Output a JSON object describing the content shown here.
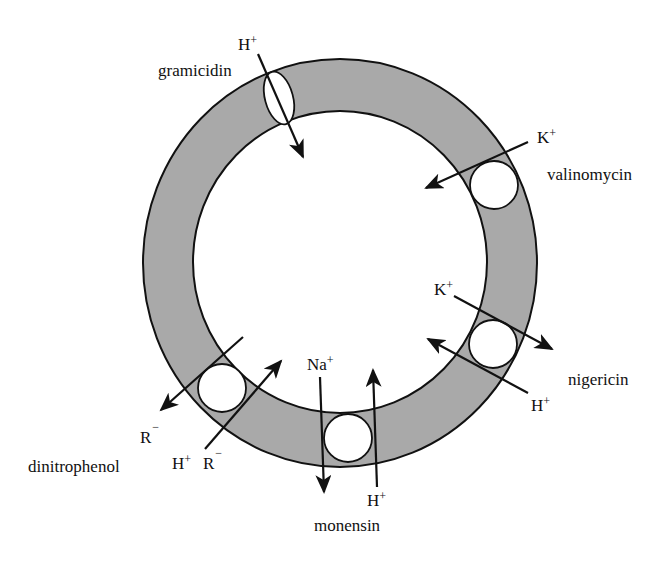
{
  "diagram": {
    "type": "membrane-ionophore-schematic",
    "colors": {
      "membrane_fill": "#a9a9a9",
      "stroke": "#111111",
      "background": "#ffffff",
      "pore_fill": "#ffffff"
    },
    "ionophores": [
      {
        "name": "gramicidin",
        "label": "gramicidin",
        "shape": "channel (ellipse)",
        "ions": [
          {
            "ion": "H",
            "charge": "+",
            "direction": "inward"
          }
        ]
      },
      {
        "name": "valinomycin",
        "label": "valinomycin",
        "shape": "carrier (circle)",
        "ions": [
          {
            "ion": "K",
            "charge": "+",
            "direction": "inward"
          }
        ]
      },
      {
        "name": "nigericin",
        "label": "nigericin",
        "shape": "carrier (circle)",
        "ions": [
          {
            "ion": "K",
            "charge": "+",
            "direction": "outward"
          },
          {
            "ion": "H",
            "charge": "+",
            "direction": "inward"
          }
        ]
      },
      {
        "name": "monensin",
        "label": "monensin",
        "shape": "carrier (circle)",
        "ions": [
          {
            "ion": "Na",
            "charge": "+",
            "direction": "outward"
          },
          {
            "ion": "H",
            "charge": "+",
            "direction": "inward"
          }
        ]
      },
      {
        "name": "dinitrophenol",
        "label": "dinitrophenol",
        "shape": "carrier (circle)",
        "ions": [
          {
            "ion": "R",
            "charge": "−",
            "direction": "outward"
          },
          {
            "ion": "H+ R",
            "charge": "−",
            "direction": "inward"
          }
        ]
      }
    ],
    "labels": {
      "gramicidin_name": "gramicidin",
      "gramicidin_ion": "H",
      "gramicidin_charge": "+",
      "valinomycin_name": "valinomycin",
      "valinomycin_ion": "K",
      "valinomycin_charge": "+",
      "nigericin_name": "nigericin",
      "nigericin_ion_k": "K",
      "nigericin_ion_k_charge": "+",
      "nigericin_ion_h": "H",
      "nigericin_ion_h_charge": "+",
      "monensin_name": "monensin",
      "monensin_ion_na": "Na",
      "monensin_ion_na_charge": "+",
      "monensin_ion_h": "H",
      "monensin_ion_h_charge": "+",
      "dinitrophenol_name": "dinitrophenol",
      "dinitrophenol_out_ion": "R",
      "dinitrophenol_out_charge": "−",
      "dinitrophenol_in_ion_h": "H",
      "dinitrophenol_in_ion_h_charge": "+",
      "dinitrophenol_in_ion_r": "R",
      "dinitrophenol_in_ion_r_charge": "−"
    }
  }
}
